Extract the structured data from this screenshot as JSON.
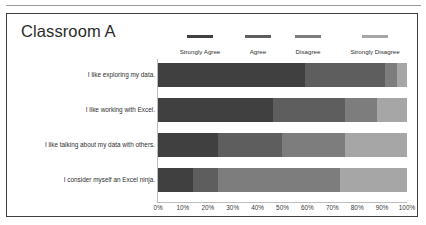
{
  "page": {
    "background_color": "#ffffff",
    "rule_color": "#9a9a9a",
    "frame_color": "#3f3f3f"
  },
  "chart_title": "Classroom A",
  "legend": {
    "position": "top-right",
    "items": [
      {
        "label": "Strongly Agree",
        "color": "#404040",
        "left": 2,
        "width": 62,
        "swatch_width": 26
      },
      {
        "label": "Agree",
        "color": "#5e5e5e",
        "left": 70,
        "width": 42,
        "swatch_width": 26
      },
      {
        "label": "Disagree",
        "color": "#7d7d7d",
        "left": 118,
        "width": 46,
        "swatch_width": 26
      },
      {
        "label": "Strongly Disagree",
        "color": "#a6a6a6",
        "left": 170,
        "width": 76,
        "swatch_width": 26
      }
    ]
  },
  "axis": {
    "tick_labels": [
      "0%",
      "10%",
      "20%",
      "30%",
      "40%",
      "50%",
      "60%",
      "70%",
      "80%",
      "90%",
      "100%"
    ],
    "min": 0,
    "max": 100,
    "step": 10,
    "line_color": "#bdbdbd"
  },
  "chart_data": {
    "type": "bar",
    "orientation": "horizontal",
    "stacked": true,
    "normalized_percent": true,
    "title": "Classroom A",
    "xlabel": "",
    "ylabel": "",
    "xlim": [
      0,
      100
    ],
    "grid": false,
    "legend_position": "top-right",
    "categories": [
      "I like exploring my data.",
      "I like working with Excel.",
      "I like talking about my data with others.",
      "I consider myself an Excel ninja."
    ],
    "series": [
      {
        "name": "Strongly Agree",
        "color": "#404040",
        "values": [
          59,
          46,
          24,
          14
        ]
      },
      {
        "name": "Agree",
        "color": "#5e5e5e",
        "values": [
          32,
          29,
          26,
          10
        ]
      },
      {
        "name": "Disagree",
        "color": "#7d7d7d",
        "values": [
          5,
          13,
          25,
          49
        ]
      },
      {
        "name": "Strongly Disagree",
        "color": "#a6a6a6",
        "values": [
          4,
          12,
          25,
          27
        ]
      }
    ]
  }
}
